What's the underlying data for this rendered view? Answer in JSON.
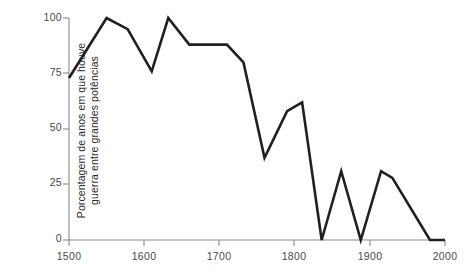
{
  "chart_data": {
    "type": "line",
    "title": "",
    "subtitle": "",
    "xlabel": "",
    "ylabel": "Porcentagem de anos em que houve guerra entre grandes potências",
    "ylabel_lines": [
      "Porcentagem de anos em que houve",
      "guerra entre grandes potências"
    ],
    "xlim": [
      1500,
      2000
    ],
    "ylim": [
      0,
      100
    ],
    "xticks": [
      1500,
      1600,
      1700,
      1800,
      1900,
      2000
    ],
    "xtick_labels": [
      "1500",
      "1600",
      "1700",
      "1800",
      "1900",
      "2000"
    ],
    "yticks": [
      0,
      25,
      50,
      75,
      100
    ],
    "ytick_labels": [
      "0",
      "25",
      "50",
      "75",
      "100"
    ],
    "grid": false,
    "legend": false,
    "legend_position": "none",
    "line_color": "#231f20",
    "axis_color": "#8a8a8a",
    "background_color": "#ffffff",
    "series": [
      {
        "name": "Porcentagem de anos em que houve guerra entre grandes potências",
        "x": [
          1500,
          1550,
          1578,
          1610,
          1632,
          1660,
          1710,
          1732,
          1760,
          1790,
          1810,
          1836,
          1862,
          1888,
          1915,
          1930,
          1980,
          2000
        ],
        "values": [
          73,
          100,
          95,
          76,
          100,
          88,
          88,
          80,
          37,
          58,
          62,
          0,
          31,
          0,
          31,
          28,
          0,
          0
        ]
      }
    ]
  }
}
